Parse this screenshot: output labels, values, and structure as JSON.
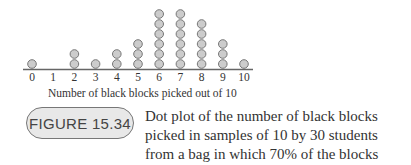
{
  "chart_data": {
    "type": "scatter",
    "subtype": "dot_plot",
    "title": "",
    "xlabel": "Number of black blocks picked out of 10",
    "ylabel": "",
    "categories": [
      "0",
      "1",
      "2",
      "3",
      "4",
      "5",
      "6",
      "7",
      "8",
      "9",
      "10"
    ],
    "x": [
      0,
      1,
      2,
      3,
      4,
      5,
      6,
      7,
      8,
      9,
      10
    ],
    "values": [
      1,
      0,
      2,
      1,
      2,
      3,
      6,
      6,
      5,
      3,
      1
    ],
    "total": 30,
    "xlim": [
      0,
      10
    ],
    "grid": false,
    "legend": null,
    "dot_color": "#cccccc",
    "dot_stroke": "#777777"
  },
  "figure": {
    "label": "FIGURE 15.34",
    "caption": "Dot plot of the number of black blocks picked in samples of 10 by 30 students from a bag in which 70% of the blocks were black"
  }
}
